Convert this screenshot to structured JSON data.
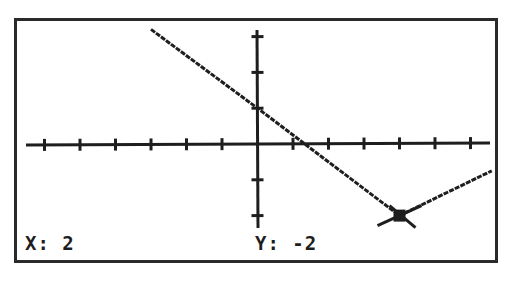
{
  "screen": {
    "type": "graphing-calculator-trace",
    "colors": {
      "background": "#ffffff",
      "ink": "#1e1e1e",
      "border": "#2a2a2a"
    }
  },
  "trace": {
    "x_label": "X:",
    "x_value": "2",
    "y_label": "Y:",
    "y_value": "-2"
  },
  "chart_data": {
    "type": "line",
    "title": "",
    "xlabel": "",
    "ylabel": "",
    "xscale": 0.5,
    "yscale": 1,
    "grid": false,
    "x_ticks": [
      -3,
      -2.5,
      -2,
      -1.5,
      -1,
      -0.5,
      0.5,
      1,
      1.5,
      2,
      2.5,
      3
    ],
    "y_ticks": [
      -2,
      -1,
      1,
      2,
      3
    ],
    "xlim": [
      -3.3,
      3.3
    ],
    "ylim": [
      -2.4,
      3.2
    ],
    "series": [
      {
        "name": "graph",
        "points": [
          [
            -1.5,
            3.2
          ],
          [
            0,
            1
          ],
          [
            2,
            -2
          ],
          [
            3.3,
            -0.75
          ]
        ]
      }
    ],
    "cursor": {
      "x": 2,
      "y": -2
    }
  }
}
